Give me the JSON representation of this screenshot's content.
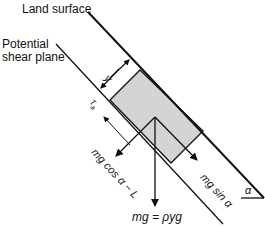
{
  "diagram": {
    "labels": {
      "land_surface": "Land surface",
      "shear_plane_line1": "Potential",
      "shear_plane_line2": "shear plane",
      "depth": "y",
      "shear_stress": "τ",
      "shear_stress_sub": "a",
      "normal_force": "mg cos α − L",
      "downslope_force": "mg sin α",
      "weight": "mg = ρyg",
      "slope_angle": "α"
    },
    "colors": {
      "line": "#111111",
      "block_fill": "#d4d4d4",
      "background": "#ffffff"
    }
  }
}
